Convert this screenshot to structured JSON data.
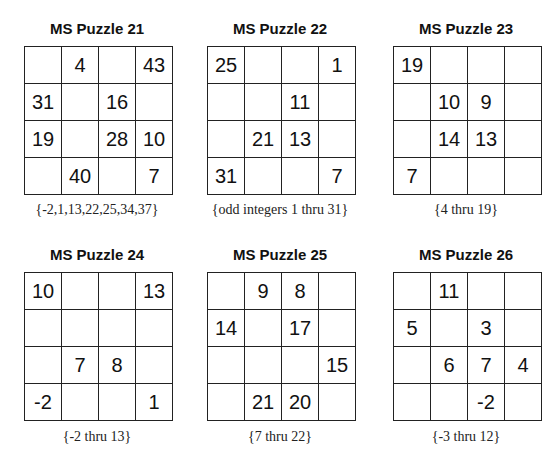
{
  "puzzles": [
    {
      "title": "MS Puzzle 21",
      "grid": [
        [
          "",
          "4",
          "",
          "43"
        ],
        [
          "31",
          "",
          "16",
          ""
        ],
        [
          "19",
          "",
          "28",
          "10"
        ],
        [
          "",
          "40",
          "",
          "7"
        ]
      ],
      "caption": "{-2,1,13,22,25,34,37}"
    },
    {
      "title": "MS Puzzle 22",
      "grid": [
        [
          "25",
          "",
          "",
          "1"
        ],
        [
          "",
          "",
          "11",
          ""
        ],
        [
          "",
          "21",
          "13",
          ""
        ],
        [
          "31",
          "",
          "",
          "7"
        ]
      ],
      "caption": "{odd integers 1 thru 31}"
    },
    {
      "title": "MS Puzzle 23",
      "grid": [
        [
          "19",
          "",
          "",
          ""
        ],
        [
          "",
          "10",
          "9",
          ""
        ],
        [
          "",
          "14",
          "13",
          ""
        ],
        [
          "7",
          "",
          "",
          ""
        ]
      ],
      "caption": "{4 thru 19}"
    },
    {
      "title": "MS Puzzle 24",
      "grid": [
        [
          "10",
          "",
          "",
          "13"
        ],
        [
          "",
          "",
          "",
          ""
        ],
        [
          "",
          "7",
          "8",
          ""
        ],
        [
          "-2",
          "",
          "",
          "1"
        ]
      ],
      "caption": "{-2 thru 13}"
    },
    {
      "title": "MS Puzzle 25",
      "grid": [
        [
          "",
          "9",
          "8",
          ""
        ],
        [
          "14",
          "",
          "17",
          ""
        ],
        [
          "",
          "",
          "",
          "15"
        ],
        [
          "",
          "21",
          "20",
          ""
        ]
      ],
      "caption": "{7 thru 22}"
    },
    {
      "title": "MS Puzzle 26",
      "grid": [
        [
          "",
          "11",
          "",
          ""
        ],
        [
          "5",
          "",
          "3",
          ""
        ],
        [
          "",
          "6",
          "7",
          "4"
        ],
        [
          "",
          "",
          "-2",
          ""
        ]
      ],
      "caption": "{-3 thru 12}"
    }
  ]
}
